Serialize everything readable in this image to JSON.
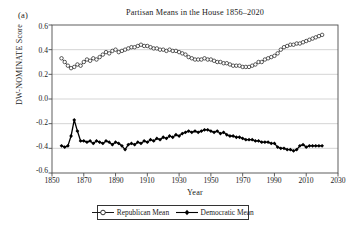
{
  "panel": {
    "label": "(a)"
  },
  "axis": {
    "y_label": "DW-NOMINATE Score",
    "x_label": "Year",
    "y_ticks": [
      "0.6",
      "0.4",
      "0.2",
      "0.0",
      "-0.2",
      "-0.4",
      "-0.6"
    ],
    "x_ticks": [
      "1850",
      "1870",
      "1890",
      "1910",
      "1930",
      "1950",
      "1970",
      "1990",
      "2010",
      "2030"
    ]
  },
  "legend": {
    "items": [
      {
        "label": "Republican Mean",
        "marker": "open-circle",
        "color": "#1a1a1a"
      },
      {
        "label": "Democratic Mean",
        "marker": "filled-diamond",
        "color": "#000000"
      }
    ]
  },
  "chart_data": {
    "type": "line",
    "title": "Partisan Means in the House 1856–2020",
    "xlabel": "Year",
    "ylabel": "DW-NOMINATE Score",
    "xlim": [
      1850,
      2030
    ],
    "ylim": [
      -0.6,
      0.6
    ],
    "grid": true,
    "grid_axis": "y",
    "legend_position": "below-axes",
    "xtick_step": 20,
    "ytick_step": 0.2,
    "series": [
      {
        "name": "Republican Mean",
        "marker": "open-circle",
        "color": "#1a1a1a",
        "x": [
          1856,
          1858,
          1860,
          1862,
          1864,
          1866,
          1868,
          1870,
          1872,
          1874,
          1876,
          1878,
          1880,
          1882,
          1884,
          1886,
          1888,
          1890,
          1892,
          1894,
          1896,
          1898,
          1900,
          1902,
          1904,
          1906,
          1908,
          1910,
          1912,
          1914,
          1916,
          1918,
          1920,
          1922,
          1924,
          1926,
          1928,
          1930,
          1932,
          1934,
          1936,
          1938,
          1940,
          1942,
          1944,
          1946,
          1948,
          1950,
          1952,
          1954,
          1956,
          1958,
          1960,
          1962,
          1964,
          1966,
          1968,
          1970,
          1972,
          1974,
          1976,
          1978,
          1980,
          1982,
          1984,
          1986,
          1988,
          1990,
          1992,
          1994,
          1996,
          1998,
          2000,
          2002,
          2004,
          2006,
          2008,
          2010,
          2012,
          2014,
          2016,
          2018,
          2020
        ],
        "y": [
          0.33,
          0.3,
          0.27,
          0.25,
          0.26,
          0.28,
          0.27,
          0.3,
          0.32,
          0.31,
          0.33,
          0.32,
          0.34,
          0.36,
          0.38,
          0.37,
          0.39,
          0.4,
          0.38,
          0.39,
          0.4,
          0.41,
          0.42,
          0.42,
          0.43,
          0.44,
          0.43,
          0.43,
          0.42,
          0.41,
          0.41,
          0.4,
          0.4,
          0.39,
          0.4,
          0.39,
          0.39,
          0.38,
          0.37,
          0.36,
          0.34,
          0.33,
          0.32,
          0.32,
          0.32,
          0.33,
          0.32,
          0.32,
          0.31,
          0.3,
          0.3,
          0.29,
          0.29,
          0.28,
          0.27,
          0.27,
          0.27,
          0.26,
          0.26,
          0.26,
          0.27,
          0.28,
          0.3,
          0.3,
          0.32,
          0.33,
          0.34,
          0.35,
          0.37,
          0.4,
          0.42,
          0.43,
          0.44,
          0.44,
          0.45,
          0.45,
          0.46,
          0.47,
          0.48,
          0.49,
          0.5,
          0.51,
          0.52
        ]
      },
      {
        "name": "Democratic Mean",
        "marker": "filled-diamond",
        "color": "#000000",
        "x": [
          1856,
          1858,
          1860,
          1862,
          1864,
          1866,
          1868,
          1870,
          1872,
          1874,
          1876,
          1878,
          1880,
          1882,
          1884,
          1886,
          1888,
          1890,
          1892,
          1894,
          1896,
          1898,
          1900,
          1902,
          1904,
          1906,
          1908,
          1910,
          1912,
          1914,
          1916,
          1918,
          1920,
          1922,
          1924,
          1926,
          1928,
          1930,
          1932,
          1934,
          1936,
          1938,
          1940,
          1942,
          1944,
          1946,
          1948,
          1950,
          1952,
          1954,
          1956,
          1958,
          1960,
          1962,
          1964,
          1966,
          1968,
          1970,
          1972,
          1974,
          1976,
          1978,
          1980,
          1982,
          1984,
          1986,
          1988,
          1990,
          1992,
          1994,
          1996,
          1998,
          2000,
          2002,
          2004,
          2006,
          2008,
          2010,
          2012,
          2014,
          2016,
          2018,
          2020
        ],
        "y": [
          -0.38,
          -0.39,
          -0.38,
          -0.3,
          -0.17,
          -0.26,
          -0.34,
          -0.34,
          -0.35,
          -0.34,
          -0.36,
          -0.34,
          -0.35,
          -0.36,
          -0.34,
          -0.35,
          -0.37,
          -0.35,
          -0.36,
          -0.38,
          -0.41,
          -0.37,
          -0.36,
          -0.37,
          -0.35,
          -0.36,
          -0.34,
          -0.35,
          -0.33,
          -0.34,
          -0.32,
          -0.33,
          -0.31,
          -0.32,
          -0.3,
          -0.31,
          -0.29,
          -0.3,
          -0.28,
          -0.27,
          -0.26,
          -0.27,
          -0.26,
          -0.27,
          -0.26,
          -0.25,
          -0.25,
          -0.26,
          -0.27,
          -0.26,
          -0.28,
          -0.27,
          -0.29,
          -0.3,
          -0.3,
          -0.31,
          -0.31,
          -0.32,
          -0.33,
          -0.33,
          -0.33,
          -0.34,
          -0.34,
          -0.35,
          -0.35,
          -0.35,
          -0.36,
          -0.36,
          -0.39,
          -0.4,
          -0.4,
          -0.41,
          -0.41,
          -0.42,
          -0.41,
          -0.38,
          -0.37,
          -0.39,
          -0.38,
          -0.38,
          -0.38,
          -0.38,
          -0.38
        ]
      }
    ]
  }
}
